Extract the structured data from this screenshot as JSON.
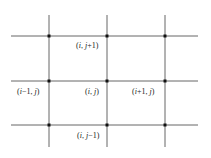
{
  "diagram": {
    "type": "finite-difference-grid-stencil",
    "colors": {
      "line": "#555555",
      "node": "#111111",
      "text": "#222222",
      "background": "#ffffff"
    },
    "grid": {
      "vertical_lines_x": [
        49,
        107,
        165
      ],
      "horizontal_lines_y": [
        36,
        81,
        125
      ],
      "x_extent": [
        11,
        198
      ],
      "y_extent": [
        15,
        147
      ]
    },
    "labels": [
      {
        "id": "north",
        "text": "(i, j+1)",
        "x": 76,
        "y": 41
      },
      {
        "id": "west",
        "text": "(i−1, j)",
        "x": 17,
        "y": 87
      },
      {
        "id": "center",
        "text": "(i, j)",
        "x": 85,
        "y": 87
      },
      {
        "id": "east",
        "text": "(i+1, j)",
        "x": 132,
        "y": 87
      },
      {
        "id": "south",
        "text": "(i, j−1)",
        "x": 77,
        "y": 131
      }
    ]
  }
}
